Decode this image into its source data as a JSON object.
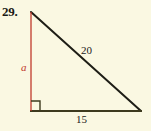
{
  "figure": {
    "problem_number": "29.",
    "background_color": "#faf8e2",
    "shape": "right-triangle",
    "labels": {
      "hypotenuse": "20",
      "base": "15",
      "vertical_leg": "a"
    },
    "colors": {
      "hypotenuse_stroke": "#1e1e16",
      "base_stroke": "#3d3a1e",
      "vertical_leg_stroke": "#c0392b",
      "right_angle_stroke": "#3d3a1e",
      "label_text": "#22221a",
      "leg_label_text": "#c0392b"
    },
    "geometry": {
      "apex": [
        31,
        12
      ],
      "right_angle_vertex": [
        31,
        111
      ],
      "base_end": [
        141,
        111
      ],
      "right_angle_marker_size": 9
    }
  }
}
